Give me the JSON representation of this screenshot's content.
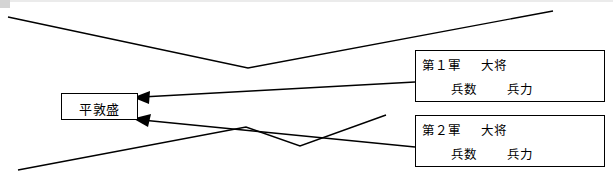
{
  "diagram": {
    "type": "flow-arrow-diagram",
    "target": {
      "label": "平敦盛"
    },
    "armies": [
      {
        "id": "army-1",
        "title": "第１軍",
        "rank": "大将",
        "fields": [
          "兵数",
          "兵力"
        ]
      },
      {
        "id": "army-2",
        "title": "第２軍",
        "rank": "大将",
        "fields": [
          "兵数",
          "兵力"
        ]
      }
    ],
    "arrows": [
      {
        "name": "arrow-army1-to-target",
        "from": "army-1",
        "to": "target",
        "head": "left"
      },
      {
        "name": "arrow-army2-to-target",
        "from": "army-2",
        "to": "target",
        "head": "left"
      }
    ],
    "colors": {
      "stroke": "#000000",
      "background": "#ffffff",
      "top_border": "#ebebeb"
    }
  }
}
